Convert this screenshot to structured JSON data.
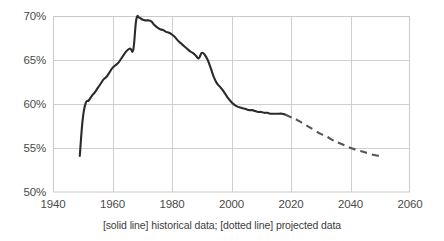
{
  "chart_data": {
    "type": "line",
    "title": "",
    "subtitle": "",
    "xlabel": "",
    "ylabel": "",
    "xlim": [
      1940,
      2060
    ],
    "ylim": [
      50,
      70
    ],
    "xticks": [
      1940,
      1960,
      1980,
      2000,
      2020,
      2040,
      2060
    ],
    "xtick_labels": [
      "1940",
      "1960",
      "1980",
      "2000",
      "2020",
      "2040",
      "2060"
    ],
    "yticks": [
      50,
      55,
      60,
      65,
      70
    ],
    "ytick_labels": [
      "50%",
      "55%",
      "60%",
      "65%",
      "70%"
    ],
    "grid": true,
    "grid_color": "#cfcfcf",
    "legend": "none",
    "caption": "[solid line] historical data; [dotted line] projected data",
    "series": [
      {
        "name": "historical data",
        "style": "solid",
        "color": "#2b2b2b",
        "x": [
          1949,
          1950,
          1951,
          1952,
          1953,
          1954,
          1955,
          1956,
          1957,
          1958,
          1959,
          1960,
          1961,
          1962,
          1963,
          1964,
          1965,
          1966,
          1967,
          1968,
          1969,
          1970,
          1971,
          1972,
          1973,
          1974,
          1975,
          1976,
          1977,
          1978,
          1979,
          1980,
          1981,
          1982,
          1983,
          1984,
          1985,
          1986,
          1987,
          1988,
          1989,
          1990,
          1991,
          1992,
          1993,
          1994,
          1995,
          1996,
          1997,
          1998,
          1999,
          2000,
          2001,
          2002,
          2003,
          2004,
          2005,
          2006,
          2007,
          2008,
          2009,
          2010,
          2011,
          2012,
          2013,
          2014,
          2015,
          2016,
          2017,
          2018
        ],
        "y": [
          54.1,
          58.3,
          60.1,
          60.4,
          60.9,
          61.3,
          61.8,
          62.3,
          62.8,
          63.1,
          63.6,
          64.1,
          64.4,
          64.7,
          65.2,
          65.7,
          66.1,
          66.3,
          66.2,
          69.6,
          69.8,
          69.6,
          69.5,
          69.5,
          69.4,
          69.0,
          68.7,
          68.5,
          68.4,
          68.2,
          68.1,
          67.9,
          67.6,
          67.2,
          66.9,
          66.6,
          66.3,
          66.0,
          65.8,
          65.5,
          65.2,
          65.8,
          65.6,
          65.0,
          64.1,
          63.1,
          62.4,
          62.0,
          61.6,
          61.1,
          60.6,
          60.2,
          59.9,
          59.7,
          59.6,
          59.5,
          59.4,
          59.3,
          59.3,
          59.2,
          59.1,
          59.1,
          59.0,
          59.0,
          58.9,
          58.9,
          58.9,
          58.9,
          58.9,
          58.8
        ]
      },
      {
        "name": "projected data",
        "style": "dashed",
        "color": "#545454",
        "x": [
          2018,
          2020,
          2022,
          2024,
          2026,
          2028,
          2030,
          2032,
          2034,
          2036,
          2038,
          2040,
          2042,
          2044,
          2046,
          2048,
          2050
        ],
        "y": [
          58.8,
          58.5,
          58.2,
          57.8,
          57.4,
          57.0,
          56.6,
          56.3,
          55.9,
          55.6,
          55.3,
          55.0,
          54.8,
          54.6,
          54.4,
          54.2,
          54.1
        ]
      }
    ]
  },
  "figure": {
    "caption": "[solid line] historical data; [dotted line] projected data",
    "plot_area": {
      "left": 53,
      "top": 16,
      "right": 410,
      "bottom": 192
    }
  }
}
